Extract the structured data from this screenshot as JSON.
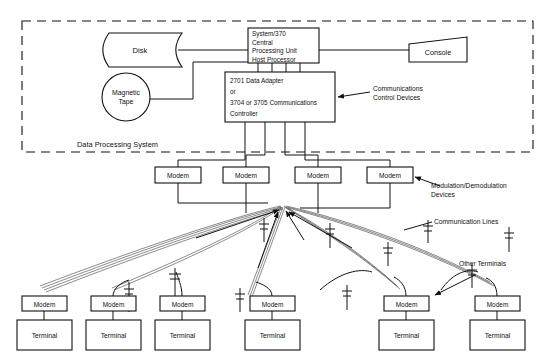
{
  "diagram": {
    "enclosure": {
      "label": "Data Processing System",
      "style": "dashed"
    },
    "nodes": {
      "disk": {
        "label": "Disk",
        "shape": "magnetic-disk"
      },
      "magnetic_tape": {
        "label_line1": "Magnetic",
        "label_line2": "Tape",
        "shape": "circle"
      },
      "console": {
        "label": "Console",
        "shape": "quadrilateral"
      },
      "cpu": {
        "shape": "rectangle",
        "lines": [
          "System/370",
          "Central",
          "Processing Unit",
          "Host Processor"
        ]
      },
      "controller": {
        "shape": "rectangle",
        "lines": [
          "2701 Data Adapter",
          "or",
          "3704 or 3705 Communications",
          "Controller"
        ]
      }
    },
    "annotations": {
      "comm_control_devices": {
        "line1": "Communications",
        "line2": "Control Devices"
      },
      "modulation_devices": {
        "line1": "Modulation/Demodulation",
        "line2": "Devices"
      },
      "communication_lines": {
        "line1": "Communication Lines"
      },
      "other_terminals": {
        "line1": "Other Terminals"
      }
    },
    "modem_row": {
      "label": "Modem",
      "items": [
        {
          "label": "Modem",
          "cx": 178
        },
        {
          "label": "Modem",
          "cx": 246
        },
        {
          "label": "Modem",
          "cx": 318
        },
        {
          "label": "Modem",
          "cx": 390
        }
      ]
    },
    "terminal_row": {
      "modem_label": "Modem",
      "terminal_label": "Terminal",
      "items": [
        {
          "modem": "Modem",
          "terminal": "Terminal",
          "cx": 44
        },
        {
          "modem": "Modem",
          "terminal": "Terminal",
          "cx": 113
        },
        {
          "modem": "Modem",
          "terminal": "Terminal",
          "cx": 182
        },
        {
          "modem": "Modem",
          "terminal": "Terminal",
          "cx": 272
        },
        {
          "modem": "Modem",
          "terminal": "Terminal",
          "cx": 406
        },
        {
          "modem": "Modem",
          "terminal": "Terminal",
          "cx": 497
        }
      ]
    },
    "colors": {
      "stroke": "#111111",
      "background": "#ffffff",
      "line_bundle": "#555555"
    }
  }
}
